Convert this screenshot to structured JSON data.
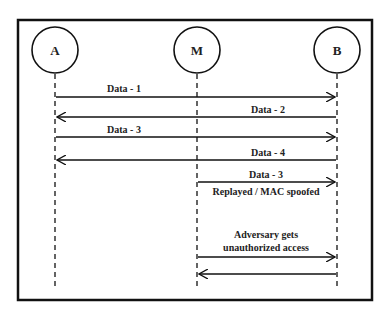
{
  "diagram": {
    "type": "sequence",
    "nodes": [
      {
        "id": "A",
        "label": "A"
      },
      {
        "id": "M",
        "label": "M"
      },
      {
        "id": "B",
        "label": "B"
      }
    ],
    "messages": [
      {
        "from": "A",
        "to": "B",
        "label": "Data - 1"
      },
      {
        "from": "B",
        "to": "A",
        "label": "Data - 2"
      },
      {
        "from": "A",
        "to": "B",
        "label": "Data - 3"
      },
      {
        "from": "B",
        "to": "A",
        "label": "Data - 4"
      },
      {
        "from": "M",
        "to": "B",
        "label": "Data - 3",
        "sublabel": "Replayed / MAC spoofed"
      },
      {
        "from": "M",
        "to": "B",
        "label_line1": "Adversary gets",
        "label_line2": "unauthorized access"
      },
      {
        "from": "B",
        "to": "M",
        "label": ""
      }
    ],
    "colors": {
      "line": "#111111",
      "background": "#ffffff"
    }
  }
}
